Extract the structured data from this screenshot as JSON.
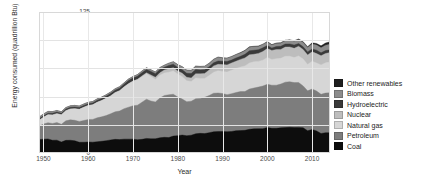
{
  "chart_data": {
    "type": "area",
    "title": "",
    "xlabel": "Year",
    "ylabel": "Energy consumed (quadrillion Btu)",
    "xlim": [
      1949,
      2014
    ],
    "ylim": [
      0,
      125
    ],
    "grid": true,
    "stacked": true,
    "legend_position": "right",
    "yticks": [
      "0",
      "25",
      "50",
      "75",
      "100",
      "125"
    ],
    "ytick_values": [
      0,
      25,
      50,
      75,
      100,
      125
    ],
    "xticks": [
      "1950",
      "1960",
      "1970",
      "1980",
      "1990",
      "2000",
      "2010"
    ],
    "xtick_values": [
      1950,
      1960,
      1970,
      1980,
      1990,
      2000,
      2010
    ],
    "x": [
      1949,
      1950,
      1951,
      1952,
      1953,
      1954,
      1955,
      1956,
      1957,
      1958,
      1959,
      1960,
      1961,
      1962,
      1963,
      1964,
      1965,
      1966,
      1967,
      1968,
      1969,
      1970,
      1971,
      1972,
      1973,
      1974,
      1975,
      1976,
      1977,
      1978,
      1979,
      1980,
      1981,
      1982,
      1983,
      1984,
      1985,
      1986,
      1987,
      1988,
      1989,
      1990,
      1991,
      1992,
      1993,
      1994,
      1995,
      1996,
      1997,
      1998,
      1999,
      2000,
      2001,
      2002,
      2003,
      2004,
      2005,
      2006,
      2007,
      2008,
      2009,
      2010,
      2011,
      2012,
      2013,
      2014
    ],
    "series": [
      {
        "name": "Coal",
        "color": "#0d0d0d",
        "values": [
          11.9,
          12.3,
          12.5,
          11.3,
          11.4,
          9.7,
          11.2,
          11.3,
          10.8,
          9.5,
          9.5,
          9.8,
          9.6,
          10.0,
          10.4,
          10.9,
          11.6,
          12.1,
          11.9,
          12.3,
          12.3,
          12.3,
          11.8,
          12.1,
          12.9,
          12.6,
          12.6,
          13.5,
          13.9,
          13.7,
          15.0,
          15.4,
          15.9,
          15.3,
          15.8,
          17.0,
          17.4,
          17.2,
          18.0,
          18.8,
          19.0,
          19.1,
          18.9,
          19.1,
          19.8,
          19.9,
          20.1,
          21.0,
          21.4,
          21.6,
          21.6,
          22.6,
          21.9,
          21.9,
          22.3,
          22.5,
          22.8,
          22.5,
          22.7,
          22.4,
          19.7,
          20.8,
          19.6,
          17.3,
          18.0,
          18.0
        ]
      },
      {
        "name": "Petroleum",
        "color": "#7d7d7d",
        "values": [
          11.9,
          13.3,
          14.4,
          14.9,
          15.6,
          15.8,
          17.3,
          18.1,
          18.2,
          18.5,
          19.3,
          19.9,
          20.2,
          21.2,
          21.7,
          22.3,
          23.2,
          24.4,
          25.3,
          27.0,
          28.3,
          29.5,
          30.6,
          32.9,
          34.8,
          33.5,
          32.7,
          35.2,
          37.1,
          37.9,
          37.1,
          34.2,
          31.9,
          30.2,
          30.1,
          31.1,
          30.9,
          32.2,
          32.9,
          34.2,
          34.2,
          33.6,
          32.8,
          33.5,
          33.8,
          34.6,
          34.4,
          35.7,
          36.2,
          36.8,
          37.8,
          38.3,
          38.2,
          38.2,
          38.8,
          40.3,
          40.4,
          39.9,
          39.8,
          37.1,
          35.4,
          35.9,
          35.3,
          34.7,
          35.1,
          35.4
        ]
      },
      {
        "name": "Natural gas",
        "color": "#d6d6d6",
        "values": [
          5.1,
          6.0,
          7.0,
          7.5,
          7.9,
          8.3,
          9.0,
          9.6,
          10.2,
          10.7,
          11.7,
          12.4,
          12.9,
          13.7,
          14.4,
          15.3,
          15.8,
          17.0,
          17.9,
          19.2,
          20.7,
          21.8,
          22.5,
          22.7,
          22.5,
          21.7,
          19.9,
          20.3,
          19.9,
          20.0,
          20.7,
          20.4,
          19.9,
          18.5,
          17.4,
          18.5,
          17.8,
          16.7,
          17.7,
          18.6,
          19.7,
          19.6,
          20.0,
          20.7,
          21.3,
          21.7,
          22.7,
          23.1,
          23.2,
          22.8,
          22.9,
          23.8,
          22.8,
          23.5,
          22.8,
          22.9,
          22.6,
          22.2,
          23.6,
          23.8,
          23.4,
          24.6,
          24.9,
          26.1,
          26.8,
          27.3
        ]
      },
      {
        "name": "Nuclear",
        "color": "#bdbdbd",
        "values": [
          0.0,
          0.0,
          0.0,
          0.0,
          0.0,
          0.0,
          0.0,
          0.0,
          0.0,
          0.0,
          0.0,
          0.0,
          0.0,
          0.0,
          0.0,
          0.0,
          0.0,
          0.1,
          0.1,
          0.1,
          0.2,
          0.2,
          0.4,
          0.6,
          0.9,
          1.3,
          1.9,
          2.1,
          2.7,
          3.0,
          2.8,
          2.7,
          3.0,
          3.1,
          3.2,
          3.6,
          4.1,
          4.4,
          4.9,
          5.6,
          5.7,
          6.1,
          6.4,
          6.5,
          6.4,
          6.8,
          7.1,
          7.2,
          6.7,
          7.1,
          7.6,
          7.9,
          8.0,
          8.1,
          7.9,
          8.2,
          8.2,
          8.2,
          8.5,
          8.4,
          8.4,
          8.4,
          8.3,
          8.1,
          8.3,
          8.3
        ]
      },
      {
        "name": "Hydroelectric",
        "color": "#3a3a3a",
        "values": [
          1.4,
          1.4,
          1.4,
          1.5,
          1.4,
          1.4,
          1.4,
          1.5,
          1.6,
          1.6,
          1.6,
          1.6,
          1.7,
          1.8,
          1.8,
          1.9,
          2.1,
          2.1,
          2.3,
          2.3,
          2.7,
          2.6,
          2.8,
          2.9,
          3.0,
          3.2,
          3.2,
          3.0,
          2.5,
          3.0,
          3.1,
          3.1,
          3.1,
          3.6,
          3.9,
          3.8,
          3.4,
          3.4,
          3.0,
          2.7,
          3.0,
          3.0,
          3.0,
          2.6,
          2.9,
          2.7,
          3.2,
          3.6,
          3.6,
          3.3,
          3.3,
          2.8,
          2.2,
          2.7,
          2.8,
          2.7,
          2.7,
          2.9,
          2.4,
          2.5,
          2.7,
          2.5,
          3.1,
          2.6,
          2.6,
          2.5
        ]
      },
      {
        "name": "Biomass",
        "color": "#8c8c8c",
        "values": [
          1.5,
          1.6,
          1.6,
          1.5,
          1.4,
          1.4,
          1.4,
          1.4,
          1.4,
          1.4,
          1.4,
          1.3,
          1.3,
          1.3,
          1.3,
          1.3,
          1.3,
          1.3,
          1.3,
          1.3,
          1.4,
          1.4,
          1.4,
          1.5,
          1.5,
          1.5,
          1.5,
          1.7,
          1.8,
          2.0,
          2.2,
          2.5,
          2.6,
          2.7,
          2.8,
          2.9,
          3.0,
          2.9,
          2.9,
          3.0,
          3.2,
          2.7,
          2.8,
          2.9,
          2.9,
          3.0,
          3.1,
          3.2,
          3.1,
          2.9,
          2.9,
          3.0,
          2.6,
          2.7,
          2.8,
          3.0,
          3.1,
          3.3,
          3.5,
          3.8,
          3.9,
          4.5,
          4.5,
          4.5,
          4.8,
          4.9
        ]
      },
      {
        "name": "Other renewables",
        "color": "#1f1f1f",
        "values": [
          0.0,
          0.0,
          0.0,
          0.0,
          0.0,
          0.0,
          0.0,
          0.0,
          0.0,
          0.0,
          0.0,
          0.0,
          0.0,
          0.0,
          0.0,
          0.0,
          0.0,
          0.0,
          0.0,
          0.0,
          0.0,
          0.0,
          0.0,
          0.0,
          0.0,
          0.0,
          0.0,
          0.0,
          0.0,
          0.0,
          0.1,
          0.1,
          0.1,
          0.1,
          0.1,
          0.2,
          0.2,
          0.2,
          0.2,
          0.2,
          0.3,
          0.3,
          0.3,
          0.3,
          0.3,
          0.3,
          0.4,
          0.4,
          0.4,
          0.4,
          0.4,
          0.4,
          0.4,
          0.4,
          0.4,
          0.4,
          0.5,
          0.5,
          0.6,
          0.7,
          0.8,
          1.0,
          1.4,
          1.7,
          1.9,
          2.2
        ]
      }
    ]
  },
  "legend": {
    "items": [
      {
        "label": "Other renewables",
        "color": "#1f1f1f"
      },
      {
        "label": "Biomass",
        "color": "#8c8c8c"
      },
      {
        "label": "Hydroelectric",
        "color": "#3a3a3a"
      },
      {
        "label": "Nuclear",
        "color": "#bdbdbd"
      },
      {
        "label": "Natural gas",
        "color": "#d6d6d6"
      },
      {
        "label": "Petroleum",
        "color": "#7d7d7d"
      },
      {
        "label": "Coal",
        "color": "#0d0d0d"
      }
    ]
  }
}
